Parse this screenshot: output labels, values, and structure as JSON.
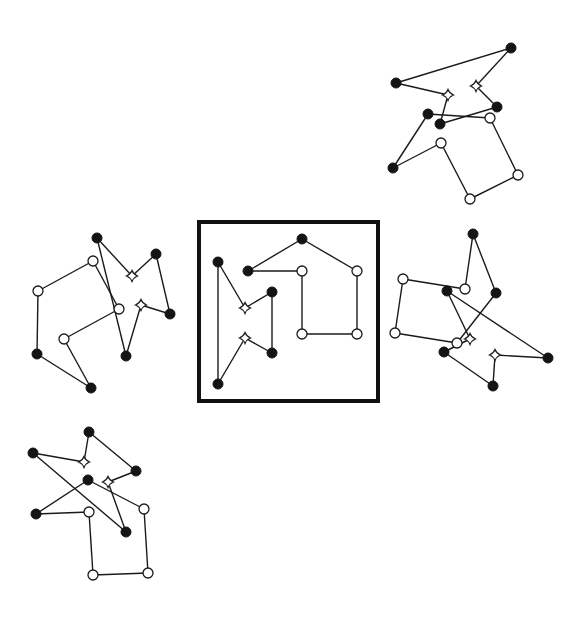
{
  "diagram": {
    "colors": {
      "line": "#1a1a1a",
      "filled_node": "#141414",
      "open_node": "#ffffff",
      "frame": "#111111",
      "background": "#ffffff"
    },
    "node_types": {
      "filled": "filled-circle",
      "open": "open-circle",
      "star": "four-point-star"
    },
    "figures": [
      {
        "id": "reference",
        "framed": true,
        "nodes": [
          {
            "id": "c1",
            "type": "filled"
          },
          {
            "id": "c2",
            "type": "filled"
          },
          {
            "id": "c3",
            "type": "filled"
          },
          {
            "id": "c4",
            "type": "open"
          },
          {
            "id": "c5",
            "type": "open"
          },
          {
            "id": "c6",
            "type": "filled"
          },
          {
            "id": "s1",
            "type": "star"
          },
          {
            "id": "s2",
            "type": "star"
          },
          {
            "id": "c7",
            "type": "open"
          },
          {
            "id": "c8",
            "type": "open"
          },
          {
            "id": "c9",
            "type": "filled"
          },
          {
            "id": "c10",
            "type": "filled"
          }
        ],
        "edges": [
          [
            "c1",
            "s1"
          ],
          [
            "s1",
            "c6"
          ],
          [
            "c6",
            "c9"
          ],
          [
            "c9",
            "s2"
          ],
          [
            "s2",
            "c10"
          ],
          [
            "c10",
            "c1"
          ],
          [
            "c3",
            "c2"
          ],
          [
            "c2",
            "c5"
          ],
          [
            "c5",
            "c8"
          ],
          [
            "c8",
            "c7"
          ],
          [
            "c7",
            "c4"
          ],
          [
            "c4",
            "c3"
          ]
        ]
      },
      {
        "id": "option-top-right",
        "framed": false,
        "nodes": [
          {
            "id": "a",
            "type": "filled"
          },
          {
            "id": "b",
            "type": "filled"
          },
          {
            "id": "s1",
            "type": "star"
          },
          {
            "id": "s2",
            "type": "star"
          },
          {
            "id": "c",
            "type": "filled"
          },
          {
            "id": "d",
            "type": "filled"
          },
          {
            "id": "e",
            "type": "filled"
          },
          {
            "id": "f",
            "type": "open"
          },
          {
            "id": "g",
            "type": "open"
          },
          {
            "id": "h",
            "type": "filled"
          },
          {
            "id": "i",
            "type": "open"
          },
          {
            "id": "j",
            "type": "open"
          }
        ],
        "edges": [
          [
            "b",
            "a"
          ],
          [
            "a",
            "s2"
          ],
          [
            "s2",
            "c"
          ],
          [
            "c",
            "e"
          ],
          [
            "e",
            "s1"
          ],
          [
            "s1",
            "b"
          ],
          [
            "d",
            "f"
          ],
          [
            "f",
            "i"
          ],
          [
            "i",
            "j"
          ],
          [
            "j",
            "g"
          ],
          [
            "g",
            "h"
          ],
          [
            "h",
            "d"
          ]
        ]
      },
      {
        "id": "option-left",
        "framed": false,
        "nodes": [
          {
            "id": "p1",
            "type": "filled"
          },
          {
            "id": "p2",
            "type": "filled"
          },
          {
            "id": "p3",
            "type": "open"
          },
          {
            "id": "s1",
            "type": "star"
          },
          {
            "id": "p4",
            "type": "open"
          },
          {
            "id": "s2",
            "type": "star"
          },
          {
            "id": "p5",
            "type": "open"
          },
          {
            "id": "p6",
            "type": "filled"
          },
          {
            "id": "p7",
            "type": "open"
          },
          {
            "id": "p8",
            "type": "filled"
          },
          {
            "id": "p9",
            "type": "filled"
          },
          {
            "id": "p10",
            "type": "filled"
          }
        ],
        "edges": [
          [
            "p1",
            "s1"
          ],
          [
            "s1",
            "p2"
          ],
          [
            "p2",
            "p6"
          ],
          [
            "p6",
            "s2"
          ],
          [
            "s2",
            "p9"
          ],
          [
            "p9",
            "p1"
          ],
          [
            "p3",
            "p4"
          ],
          [
            "p4",
            "p8"
          ],
          [
            "p8",
            "p10"
          ],
          [
            "p10",
            "p7"
          ],
          [
            "p7",
            "p5"
          ],
          [
            "p5",
            "p3"
          ]
        ]
      },
      {
        "id": "option-right",
        "framed": false,
        "nodes": [
          {
            "id": "q1",
            "type": "filled"
          },
          {
            "id": "q2",
            "type": "open"
          },
          {
            "id": "q3",
            "type": "open"
          },
          {
            "id": "q4",
            "type": "filled"
          },
          {
            "id": "q5",
            "type": "filled"
          },
          {
            "id": "q6",
            "type": "open"
          },
          {
            "id": "s1",
            "type": "star"
          },
          {
            "id": "q7",
            "type": "open"
          },
          {
            "id": "q8",
            "type": "filled"
          },
          {
            "id": "s2",
            "type": "star"
          },
          {
            "id": "q9",
            "type": "filled"
          },
          {
            "id": "q10",
            "type": "filled"
          }
        ],
        "edges": [
          [
            "q4",
            "s1"
          ],
          [
            "s1",
            "q8"
          ],
          [
            "q8",
            "q10"
          ],
          [
            "q10",
            "s2"
          ],
          [
            "s2",
            "q9"
          ],
          [
            "q9",
            "q4"
          ],
          [
            "q1",
            "q3"
          ],
          [
            "q3",
            "q2"
          ],
          [
            "q2",
            "q6"
          ],
          [
            "q6",
            "q7"
          ],
          [
            "q7",
            "q5"
          ],
          [
            "q5",
            "q1"
          ]
        ]
      },
      {
        "id": "option-bottom-left",
        "framed": false,
        "nodes": [
          {
            "id": "r1",
            "type": "filled"
          },
          {
            "id": "r2",
            "type": "filled"
          },
          {
            "id": "s1",
            "type": "star"
          },
          {
            "id": "r3",
            "type": "filled"
          },
          {
            "id": "r4",
            "type": "filled"
          },
          {
            "id": "s2",
            "type": "star"
          },
          {
            "id": "r5",
            "type": "open"
          },
          {
            "id": "r6",
            "type": "filled"
          },
          {
            "id": "r7",
            "type": "open"
          },
          {
            "id": "r8",
            "type": "filled"
          },
          {
            "id": "r9",
            "type": "open"
          },
          {
            "id": "r10",
            "type": "open"
          }
        ],
        "edges": [
          [
            "r2",
            "s1"
          ],
          [
            "s1",
            "r1"
          ],
          [
            "r1",
            "r3"
          ],
          [
            "r3",
            "s2"
          ],
          [
            "s2",
            "r8"
          ],
          [
            "r8",
            "r2"
          ],
          [
            "r6",
            "r4"
          ],
          [
            "r4",
            "r5"
          ],
          [
            "r5",
            "r10"
          ],
          [
            "r10",
            "r9"
          ],
          [
            "r9",
            "r7"
          ],
          [
            "r7",
            "r6"
          ]
        ]
      }
    ]
  }
}
